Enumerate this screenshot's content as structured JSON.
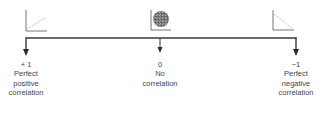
{
  "diagram": {
    "colors": {
      "line": "#3a3a3a",
      "axis": "#555555",
      "dots": "#8a8a8a",
      "cloud": "#6e6e6e",
      "text": "#444444"
    },
    "markers": [
      {
        "id": "positive",
        "value": "+ 1",
        "lines": [
          "Perfect",
          "positive",
          "correlation"
        ],
        "plot_icon": "positive-correlation-scatter-icon"
      },
      {
        "id": "none",
        "value": "0",
        "lines": [
          "No",
          "correlation"
        ],
        "plot_icon": "no-correlation-scatter-icon"
      },
      {
        "id": "negative",
        "value": "−1",
        "lines": [
          "Perfect",
          "negative",
          "correlation"
        ],
        "plot_icon": "negative-correlation-scatter-icon"
      }
    ]
  }
}
